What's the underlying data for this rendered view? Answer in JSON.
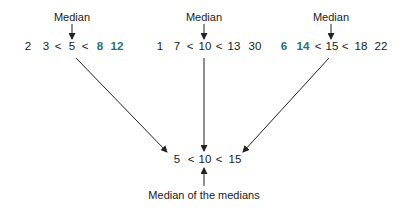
{
  "diagram": {
    "colors": {
      "text": "#1a1a1a",
      "highlight": "#1f6f80",
      "arrow": "#222222"
    },
    "groups": [
      {
        "label": "Median",
        "values": [
          "2",
          "3",
          "<",
          "5",
          "<",
          "8",
          "12"
        ],
        "highlighted": [
          "8",
          "12"
        ],
        "median": "5"
      },
      {
        "label": "Median",
        "values": [
          "1",
          "7",
          "<",
          "10",
          "<",
          "13",
          "30"
        ],
        "highlighted": [],
        "median": "10"
      },
      {
        "label": "Median",
        "values": [
          "6",
          "14",
          "<",
          "15",
          "<",
          "18",
          "22"
        ],
        "highlighted": [
          "6",
          "14"
        ],
        "median": "15"
      }
    ],
    "medians_row": [
      "5",
      "<",
      "10",
      "<",
      "15"
    ],
    "result_label": "Median of the medians"
  }
}
